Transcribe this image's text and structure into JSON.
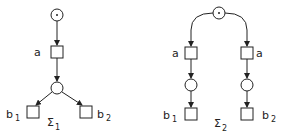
{
  "nets": [
    {
      "id": "sigma1",
      "caption": "Σ",
      "caption_sub": "1",
      "places": [
        {
          "id": "p0",
          "x": 57,
          "y": 15,
          "marked": true
        },
        {
          "id": "p1",
          "x": 57,
          "y": 88,
          "marked": false
        }
      ],
      "transitions": [
        {
          "id": "ta",
          "x": 57,
          "y": 52,
          "label": "a",
          "label_sub": ""
        },
        {
          "id": "tb1",
          "x": 33,
          "y": 112,
          "label": "b",
          "label_sub": "1"
        },
        {
          "id": "tb2",
          "x": 86,
          "y": 112,
          "label": "b",
          "label_sub": "2"
        }
      ]
    },
    {
      "id": "sigma2",
      "caption": "Σ",
      "caption_sub": "2",
      "places": [
        {
          "id": "p0",
          "x": 219,
          "y": 13,
          "marked": true
        },
        {
          "id": "p1",
          "x": 191,
          "y": 85,
          "marked": false
        },
        {
          "id": "p2",
          "x": 247,
          "y": 85,
          "marked": false
        }
      ],
      "transitions": [
        {
          "id": "ta1",
          "x": 191,
          "y": 53,
          "label": "a",
          "label_sub": ""
        },
        {
          "id": "ta2",
          "x": 247,
          "y": 53,
          "label": "a",
          "label_sub": ""
        },
        {
          "id": "tb1",
          "x": 191,
          "y": 114,
          "label": "b",
          "label_sub": "1"
        },
        {
          "id": "tb2",
          "x": 247,
          "y": 114,
          "label": "b",
          "label_sub": "2"
        }
      ]
    }
  ],
  "labels": {
    "s1_a": "a",
    "s1_b1": "b",
    "s1_b1_sub": "1",
    "s1_b2": "b",
    "s1_b2_sub": "2",
    "s1_caption": "Σ",
    "s1_caption_sub": "1",
    "s2_a_left": "a",
    "s2_a_right": "a",
    "s2_b1": "b",
    "s2_b1_sub": "1",
    "s2_b2": "b",
    "s2_b2_sub": "2",
    "s2_caption": "Σ",
    "s2_caption_sub": "2"
  },
  "colors": {
    "stroke": "#222222",
    "background": "#ffffff"
  }
}
